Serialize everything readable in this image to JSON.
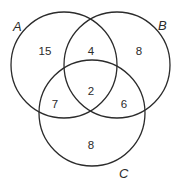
{
  "diagram": {
    "type": "venn-3",
    "sets": [
      {
        "id": "A",
        "label": "A",
        "cx": 64,
        "cy": 65,
        "r": 53
      },
      {
        "id": "B",
        "label": "B",
        "cx": 117,
        "cy": 65,
        "r": 53
      },
      {
        "id": "C",
        "label": "C",
        "cx": 92,
        "cy": 113,
        "r": 53
      }
    ],
    "regions": {
      "a_only": "15",
      "ab_only": "4",
      "b_only": "8",
      "abc": "2",
      "ac_only": "7",
      "bc_only": "6",
      "c_only": "8"
    },
    "stroke_color": "#2b2b2b"
  }
}
